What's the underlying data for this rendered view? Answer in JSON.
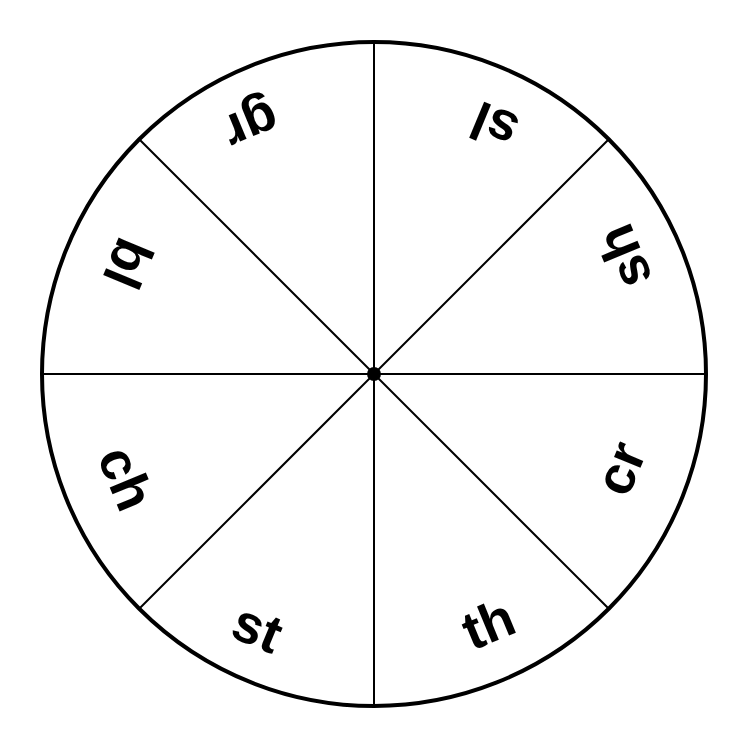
{
  "wheel": {
    "center": [
      374,
      374
    ],
    "radius": 332,
    "stroke_color": "#000000",
    "background": "#ffffff",
    "segments": [
      {
        "label": "gr",
        "angle": -112.5
      },
      {
        "label": "sl",
        "angle": -67.5
      },
      {
        "label": "sh",
        "angle": -22.5
      },
      {
        "label": "cr",
        "angle": 22.5
      },
      {
        "label": "th",
        "angle": 67.5
      },
      {
        "label": "st",
        "angle": 112.5
      },
      {
        "label": "ch",
        "angle": 157.5
      },
      {
        "label": "bl",
        "angle": -157.5
      }
    ]
  }
}
